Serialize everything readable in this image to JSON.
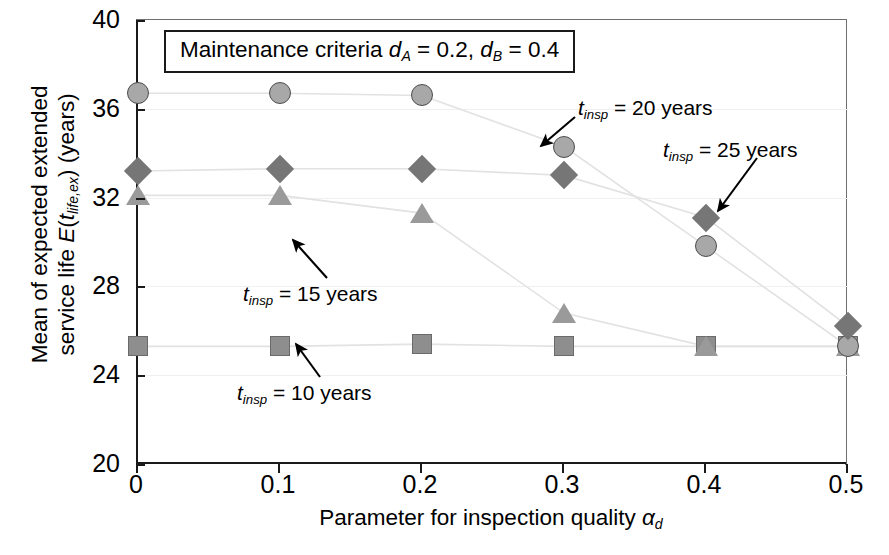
{
  "chart_data": {
    "type": "scatter",
    "title": "",
    "xlabel": "Parameter for inspection quality αd",
    "ylabel": "Mean of expected extended service life E(tlife,ex) (years)",
    "xlim": [
      0,
      0.5
    ],
    "ylim": [
      20,
      40
    ],
    "grid": true,
    "legend_position": "annotations",
    "x": [
      0,
      0.1,
      0.2,
      0.3,
      0.4,
      0.5
    ],
    "xticks": [
      "0",
      "0.1",
      "0.2",
      "0.3",
      "0.4",
      "0.5"
    ],
    "yticks": [
      "20",
      "24",
      "28",
      "32",
      "36",
      "40"
    ],
    "series": [
      {
        "name": "t_insp = 10 years",
        "marker": "square",
        "color": "#8e8e8e",
        "values": [
          25.3,
          25.3,
          25.4,
          25.3,
          25.3,
          25.3
        ]
      },
      {
        "name": "t_insp = 15 years",
        "marker": "triangle",
        "color": "#9a9a9a",
        "values": [
          32.1,
          32.1,
          31.3,
          26.8,
          25.3,
          25.3
        ]
      },
      {
        "name": "t_insp = 20 years",
        "marker": "circle",
        "color": "#a8a8a8",
        "values": [
          36.7,
          36.7,
          36.6,
          34.3,
          29.8,
          25.3
        ]
      },
      {
        "name": "t_insp = 25 years",
        "marker": "diamond",
        "color": "#767676",
        "values": [
          33.2,
          33.3,
          33.3,
          33.0,
          31.1,
          26.2
        ]
      }
    ],
    "annotations": [
      {
        "text": "t_insp = 20 years",
        "target_x": 0.3,
        "target_y": 34.3
      },
      {
        "text": "t_insp = 25 years",
        "target_x": 0.4,
        "target_y": 31.1
      },
      {
        "text": "t_insp = 15 years",
        "target_x": 0.2,
        "target_y": 31.3
      },
      {
        "text": "t_insp = 10 years",
        "target_x": 0.2,
        "target_y": 25.4
      }
    ],
    "criteria_box": "Maintenance criteria dA = 0.2, dB = 0.4"
  },
  "axes": {
    "y_tick_labels": [
      "40",
      "36",
      "32",
      "28",
      "24",
      "20"
    ],
    "x_tick_labels": [
      "0",
      "0.1",
      "0.2",
      "0.3",
      "0.4",
      "0.5"
    ],
    "y_title_line1": "Mean of expected extended",
    "y_title_line2_pre": "service life ",
    "y_title_line2_E": "E",
    "y_title_line2_paren1": "(",
    "y_title_line2_t": "t",
    "y_title_line2_sub": "life,ex",
    "y_title_line2_post": ") (years)",
    "x_title_pre": "Parameter for inspection quality ",
    "x_title_alpha": "α",
    "x_title_alpha_sub": "d"
  },
  "criteria": {
    "prefix": "Maintenance criteria ",
    "d1": "d",
    "d1_sub": "A",
    "eq1": " = 0.2, ",
    "d2": "d",
    "d2_sub": "B",
    "eq2": " = 0.4"
  },
  "annotations": {
    "a20": {
      "t": "t",
      "sub": "insp",
      "rest": " = 20 years"
    },
    "a25": {
      "t": "t",
      "sub": "insp",
      "rest": " = 25 years"
    },
    "a15": {
      "t": "t",
      "sub": "insp",
      "rest": " = 15 years"
    },
    "a10": {
      "t": "t",
      "sub": "insp",
      "rest": " = 10 years"
    }
  },
  "colors": {
    "axis": "#1a1a1a",
    "grid": "#f0f0f0",
    "circle": "#a8a8a8",
    "diamond": "#767676",
    "triangle": "#9a9a9a",
    "square": "#8e8e8e"
  }
}
